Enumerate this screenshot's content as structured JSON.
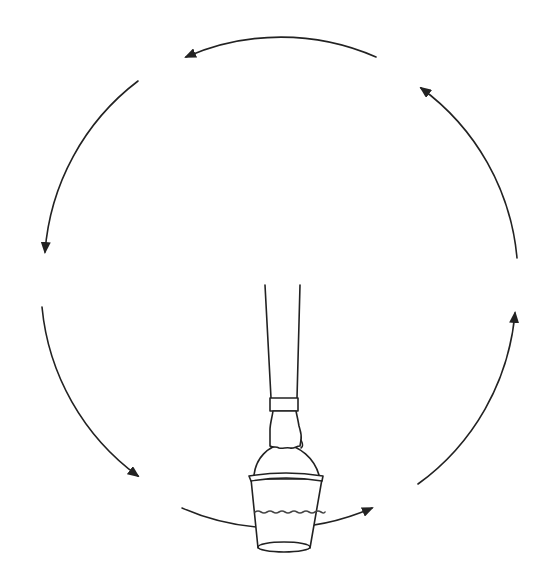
{
  "diagram": {
    "colors": {
      "line": "#222222",
      "background": "#ffffff",
      "bucket_fill": "#ffffff"
    },
    "circle": {
      "cx": 280,
      "cy": 280,
      "r": 237
    },
    "arrows": [
      {
        "id": "top",
        "direction": "counterclockwise",
        "points_to": "left"
      },
      {
        "id": "upper-left",
        "direction": "counterclockwise",
        "points_to": "down"
      },
      {
        "id": "lower-left",
        "direction": "counterclockwise",
        "points_to": "down-right"
      },
      {
        "id": "bottom",
        "direction": "counterclockwise",
        "points_to": "right"
      },
      {
        "id": "lower-right",
        "direction": "counterclockwise",
        "points_to": "up"
      },
      {
        "id": "upper-right",
        "direction": "counterclockwise",
        "points_to": "up-left"
      }
    ],
    "objects": [
      "arm",
      "cuff",
      "hand",
      "bucket-handle",
      "bucket",
      "water-surface"
    ]
  }
}
